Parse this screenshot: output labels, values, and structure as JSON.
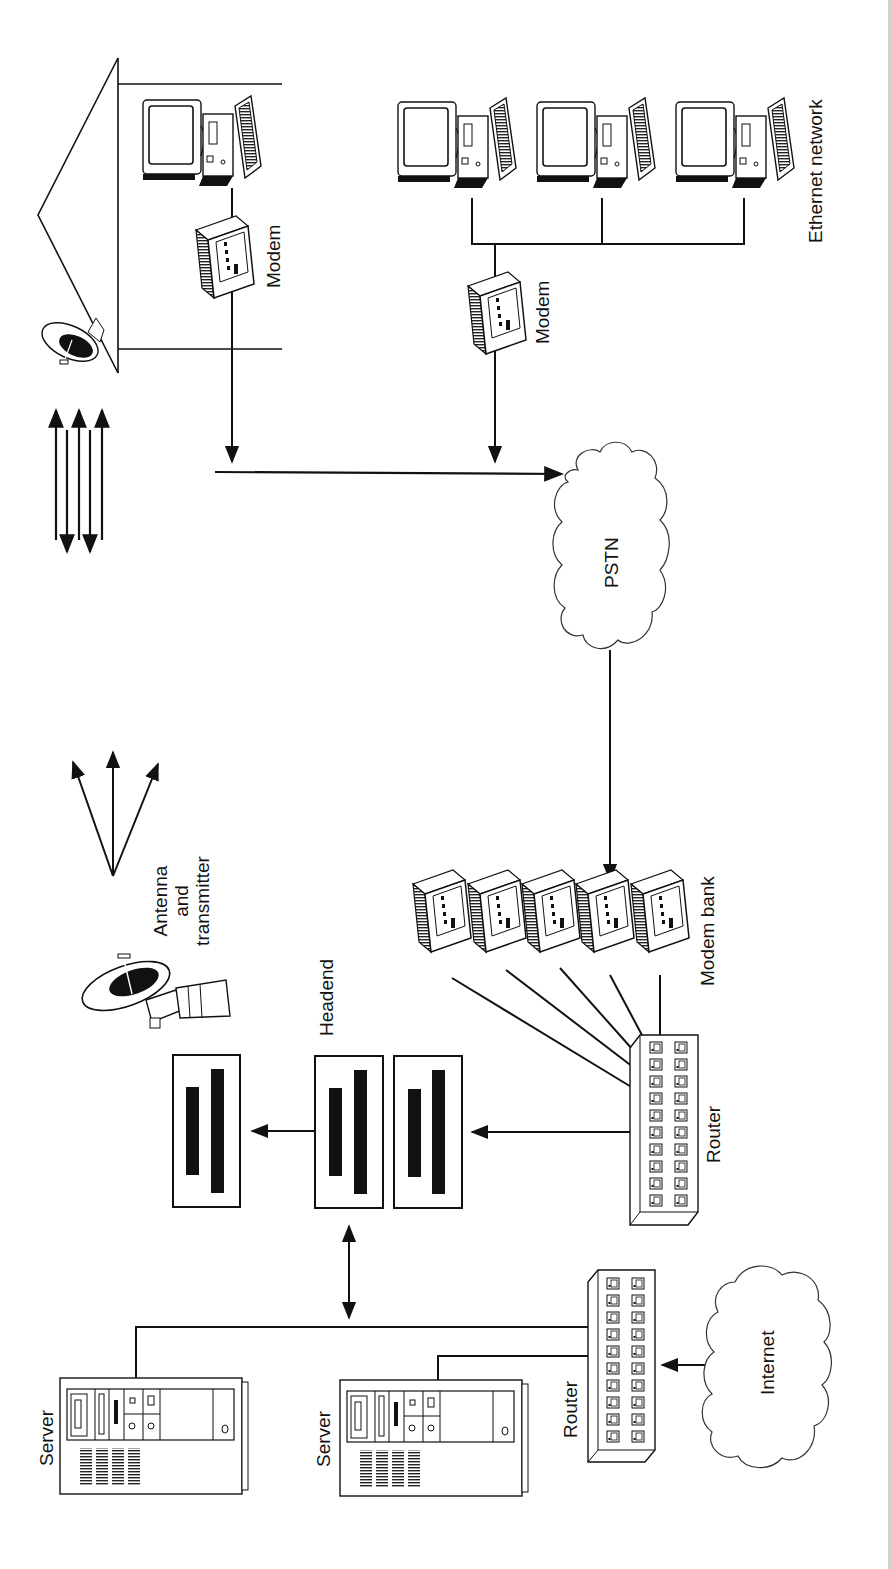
{
  "diagram": {
    "title": "",
    "orientation": "rotated-90-ccw",
    "labels": {
      "home_modem": "Modem",
      "ethernet_modem": "Modem",
      "ethernet_network": "Ethernet network",
      "pstn": "PSTN",
      "antenna_l1": "Antenna",
      "antenna_l2": "and",
      "antenna_l3": "transmitter",
      "headend": "Headend",
      "modem_bank": "Modem bank",
      "router_main": "Router",
      "router_internet": "Router",
      "internet": "Internet",
      "server_1": "Server",
      "server_2": "Server"
    },
    "nodes": [
      {
        "id": "home",
        "type": "house",
        "contains": [
          "satellite-dish",
          "pc",
          "modem"
        ]
      },
      {
        "id": "ethernet-lan",
        "type": "group",
        "pcs": 3
      },
      {
        "id": "ethernet-modem",
        "type": "modem"
      },
      {
        "id": "pstn",
        "type": "cloud"
      },
      {
        "id": "modem-bank",
        "type": "modem-group",
        "count": 5
      },
      {
        "id": "router-main",
        "type": "router",
        "ports": 20
      },
      {
        "id": "headend",
        "type": "rack-group",
        "units": 3
      },
      {
        "id": "antenna",
        "type": "satellite-antenna"
      },
      {
        "id": "router-internet",
        "type": "router",
        "ports": 20
      },
      {
        "id": "internet",
        "type": "cloud"
      },
      {
        "id": "server-1",
        "type": "server"
      },
      {
        "id": "server-2",
        "type": "server"
      }
    ],
    "edges": [
      {
        "from": "home-modem",
        "to": "pstn",
        "style": "arrow"
      },
      {
        "from": "ethernet-modem",
        "to": "pstn",
        "style": "arrow"
      },
      {
        "from": "pstn",
        "to": "modem-bank",
        "style": "arrow"
      },
      {
        "from": "modem-bank",
        "to": "router-main",
        "style": "line"
      },
      {
        "from": "router-main",
        "to": "headend",
        "style": "arrow"
      },
      {
        "from": "headend",
        "to": "antenna-unit",
        "style": "arrow"
      },
      {
        "from": "headend",
        "to": "server-bus",
        "style": "double-arrow"
      },
      {
        "from": "internet",
        "to": "router-internet",
        "style": "arrow"
      },
      {
        "from": "router-internet",
        "to": "server-1",
        "style": "line"
      },
      {
        "from": "router-internet",
        "to": "server-2",
        "style": "line"
      }
    ],
    "colors": {
      "ink": "#111111",
      "paper": "#ffffff",
      "edge": "#d0d0d0"
    }
  }
}
